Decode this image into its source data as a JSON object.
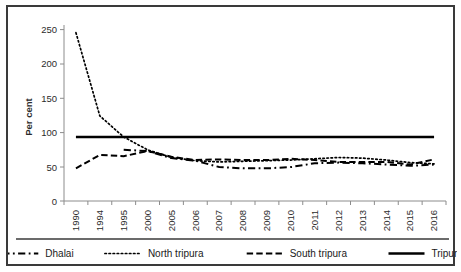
{
  "chart_data": {
    "type": "line",
    "title": "",
    "xlabel": "",
    "ylabel": "Per cent",
    "ylim": [
      0,
      275
    ],
    "yticks": [
      0,
      50,
      100,
      150,
      200,
      250
    ],
    "grid": false,
    "legend_position": "bottom",
    "categories": [
      "1990",
      "1994",
      "1995",
      "2000",
      "2005",
      "2006",
      "2007",
      "2008",
      "2009",
      "2010",
      "2011",
      "2012",
      "2013",
      "2014",
      "2015",
      "2016"
    ],
    "series": [
      {
        "name": "Dhalai",
        "style": "dash-dot",
        "values": [
          null,
          null,
          80,
          78,
          67,
          63,
          53,
          51,
          51,
          53,
          59,
          60,
          59,
          57,
          55,
          57
        ]
      },
      {
        "name": "North tripura",
        "style": "dotted",
        "values": [
          263,
          133,
          100,
          80,
          68,
          63,
          61,
          62,
          63,
          64,
          66,
          68,
          67,
          64,
          60,
          58
        ]
      },
      {
        "name": "South tripura",
        "style": "dashed",
        "values": [
          51,
          72,
          70,
          78,
          69,
          64,
          65,
          64,
          64,
          66,
          64,
          61,
          61,
          61,
          57,
          65
        ]
      },
      {
        "name": "Tripura",
        "style": "solid",
        "values": [
          100,
          100,
          100,
          100,
          100,
          100,
          100,
          100,
          100,
          100,
          100,
          100,
          100,
          100,
          100,
          100
        ]
      }
    ]
  },
  "axes": {
    "ylabel": "Per cent",
    "ytick_labels": [
      "250",
      "200",
      "150",
      "100",
      "50",
      "0"
    ],
    "xtick_labels": [
      "1990",
      "1994",
      "1995",
      "2000",
      "2005",
      "2006",
      "2007",
      "2008",
      "2009",
      "2010",
      "2011",
      "2012",
      "2013",
      "2014",
      "2015",
      "2016"
    ]
  },
  "legend": {
    "items": [
      {
        "label": "Dhalai",
        "marker": "dash-dot-line-marker"
      },
      {
        "label": "North tripura",
        "marker": "dotted-line-marker"
      },
      {
        "label": "South tripura",
        "marker": "dashed-line-marker"
      },
      {
        "label": "Tripura",
        "marker": "solid-line-marker"
      }
    ]
  },
  "colors": {
    "line": "#000000",
    "axis": "#8c8c8c",
    "text": "#2b2b2b",
    "frame": "#3a3a3a",
    "background": "#ffffff"
  }
}
